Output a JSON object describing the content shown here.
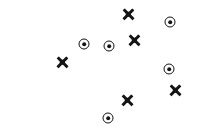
{
  "chart_data": {
    "type": "scatter",
    "title": "",
    "subtitle": "",
    "xlabel": "",
    "ylabel": "",
    "xlim": [
      0,
      200
    ],
    "ylim": [
      0,
      134
    ],
    "grid": false,
    "axes_visible": false,
    "tick_labels_x": [],
    "tick_labels_y": [],
    "legend": {
      "visible": false,
      "position": "none",
      "entries": []
    },
    "annotations": [],
    "background_color": "#ffffff",
    "marker_color": "#141414",
    "series": [
      {
        "name": "cross-series",
        "marker": "x",
        "color": "#141414",
        "points": [
          {
            "label": "x1",
            "x": 128,
            "y": 14
          },
          {
            "label": "x2",
            "x": 134,
            "y": 40
          },
          {
            "label": "x3",
            "x": 62,
            "y": 62
          },
          {
            "label": "x4",
            "x": 175,
            "y": 90
          },
          {
            "label": "x5",
            "x": 127,
            "y": 100
          }
        ]
      },
      {
        "name": "bullseye-series",
        "marker": "circle-dot",
        "color": "#141414",
        "points": [
          {
            "label": "o1",
            "x": 170,
            "y": 22
          },
          {
            "label": "o2",
            "x": 84,
            "y": 44
          },
          {
            "label": "o3",
            "x": 109,
            "y": 46
          },
          {
            "label": "o4",
            "x": 169,
            "y": 69
          },
          {
            "label": "o5",
            "x": 108,
            "y": 118
          }
        ]
      }
    ]
  }
}
